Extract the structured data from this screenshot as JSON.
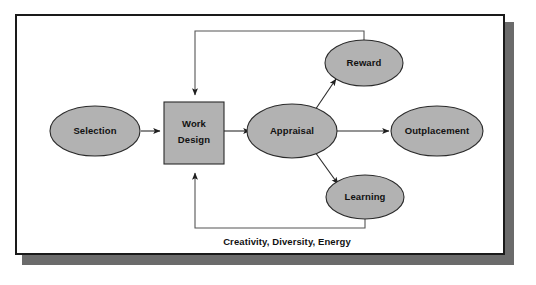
{
  "figure": {
    "caption": "Creativity, Diversity, Energy",
    "colors": {
      "shape_fill": "#b2b2b2",
      "shape_stroke": "#2a2a2a",
      "frame_border": "#1a1a1a",
      "shadow": "#6b6b6b",
      "background": "#ffffff",
      "text": "#111111"
    }
  },
  "nodes": {
    "selection": {
      "label": "Selection",
      "shape": "ellipse"
    },
    "work_design": {
      "label_line1": "Work",
      "label_line2": "Design",
      "shape": "rectangle"
    },
    "appraisal": {
      "label": "Appraisal",
      "shape": "ellipse"
    },
    "reward": {
      "label": "Reward",
      "shape": "ellipse"
    },
    "outplacement": {
      "label": "Outplacement",
      "shape": "ellipse"
    },
    "learning": {
      "label": "Learning",
      "shape": "ellipse"
    }
  },
  "edges": [
    {
      "from": "selection",
      "to": "work_design",
      "style": "arrow"
    },
    {
      "from": "work_design",
      "to": "appraisal",
      "style": "arrow"
    },
    {
      "from": "appraisal",
      "to": "reward",
      "style": "arrow"
    },
    {
      "from": "appraisal",
      "to": "outplacement",
      "style": "arrow"
    },
    {
      "from": "appraisal",
      "to": "learning",
      "style": "arrow"
    },
    {
      "from": "reward",
      "to": "work_design",
      "style": "feedback-loop-top"
    },
    {
      "from": "learning",
      "to": "work_design",
      "style": "feedback-loop-bottom"
    }
  ]
}
